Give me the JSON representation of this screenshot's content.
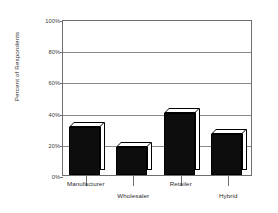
{
  "chart_data": {
    "type": "bar",
    "title": "",
    "subtitle": "",
    "xlabel": "",
    "ylabel": "Percent of Respondents",
    "categories": [
      "Manufacturer",
      "Wholesaler",
      "Retailer",
      "Hybrid"
    ],
    "values": [
      31,
      18,
      40,
      26
    ],
    "series": [
      {
        "name": "Percent of Respondents",
        "values": [
          31,
          18,
          40,
          26
        ]
      }
    ],
    "ylim": [
      0,
      100
    ],
    "y_ticks": [
      0,
      20,
      40,
      60,
      80,
      100
    ],
    "y_tick_labels": [
      "0%",
      "20%",
      "40%",
      "60%",
      "80%",
      "100%"
    ],
    "grid": "horizontal",
    "legend": "none",
    "style": "3d-bars",
    "bar_color": "#0d0d0d",
    "bar_face_color": "#ffffff",
    "axis_color": "#6e6e6e",
    "annotations": []
  },
  "axis": {
    "y_title": "Percent of Respondents"
  }
}
